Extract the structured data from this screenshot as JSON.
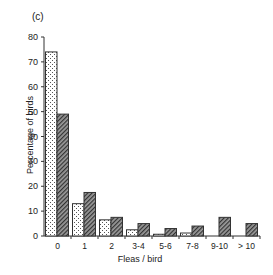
{
  "chart_data": {
    "type": "bar",
    "title": "(c)",
    "xlabel": "Fleas / bird",
    "ylabel": "Percentage of birds",
    "categories": [
      "0",
      "1",
      "2",
      "3-4",
      "5-6",
      "7-8",
      "9-10",
      "> 10"
    ],
    "series": [
      {
        "name": "stippled",
        "pattern": "dots",
        "values": [
          74,
          13,
          6.5,
          2.5,
          0.7,
          1.2,
          0,
          0
        ]
      },
      {
        "name": "hatched",
        "pattern": "diagonal",
        "values": [
          49,
          17.5,
          7.5,
          5,
          3,
          4,
          7.5,
          5
        ]
      }
    ],
    "ylim": [
      0,
      80
    ],
    "yticks": [
      0,
      10,
      20,
      30,
      40,
      50,
      60,
      70,
      80
    ],
    "grid": false,
    "legend": null
  }
}
